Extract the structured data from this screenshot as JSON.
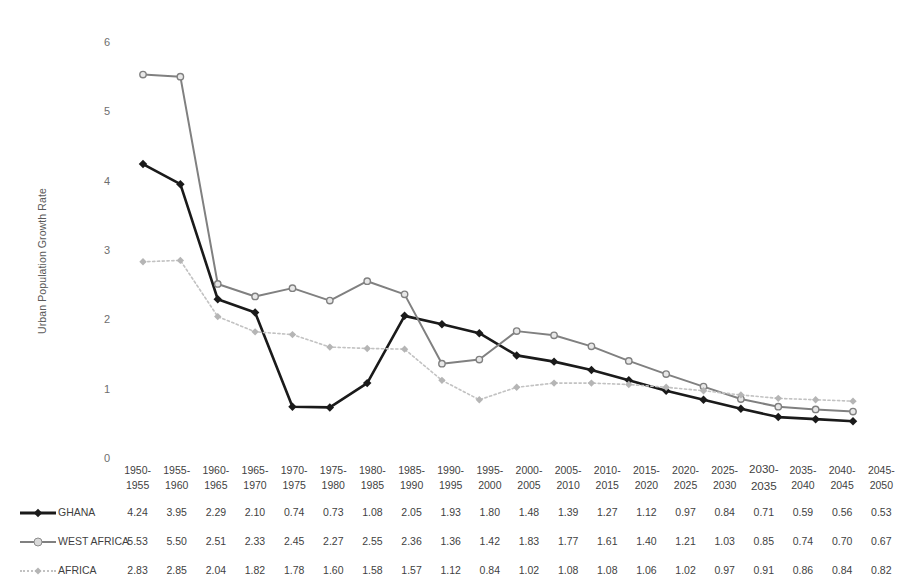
{
  "chart_data": {
    "type": "line",
    "title": "",
    "xlabel": "",
    "ylabel": "Urban Population Growth Rate",
    "ylim": [
      0,
      6
    ],
    "yticks": [
      0,
      1,
      2,
      3,
      4,
      5,
      6
    ],
    "grid": false,
    "legend_position": "left-of-table",
    "categories": [
      "1950-\n1955",
      "1955-\n1960",
      "1960-\n1965",
      "1965-\n1970",
      "1970-\n1975",
      "1975-\n1980",
      "1980-\n1985",
      "1985-\n1990",
      "1990-\n1995",
      "1995-\n2000",
      "2000-\n2005",
      "2005-\n2010",
      "2010-\n2015",
      "2015-\n2020",
      "2020-\n2025",
      "2025-\n2030",
      "2030-\n2035",
      "2035-\n2040",
      "2040-\n2045",
      "2045-\n2050"
    ],
    "series": [
      {
        "name": "GHANA",
        "color": "#1a1a1a",
        "marker": "diamond",
        "style": "solid",
        "values": [
          4.24,
          3.95,
          2.29,
          2.1,
          0.74,
          0.73,
          1.08,
          2.05,
          1.93,
          1.8,
          1.48,
          1.39,
          1.27,
          1.12,
          0.97,
          0.84,
          0.71,
          0.59,
          0.56,
          0.53
        ]
      },
      {
        "name": "WEST AFRICA",
        "color": "#808080",
        "marker": "circle",
        "style": "solid",
        "values": [
          5.53,
          5.5,
          2.51,
          2.33,
          2.45,
          2.27,
          2.55,
          2.36,
          1.36,
          1.42,
          1.83,
          1.77,
          1.61,
          1.4,
          1.21,
          1.03,
          0.85,
          0.74,
          0.7,
          0.67
        ]
      },
      {
        "name": "AFRICA",
        "color": "#c2c2c2",
        "marker": "diamond",
        "style": "dotted",
        "values": [
          2.83,
          2.85,
          2.04,
          1.82,
          1.78,
          1.6,
          1.58,
          1.57,
          1.12,
          0.84,
          1.02,
          1.08,
          1.08,
          1.06,
          1.02,
          0.97,
          0.91,
          0.86,
          0.84,
          0.82
        ]
      }
    ]
  }
}
